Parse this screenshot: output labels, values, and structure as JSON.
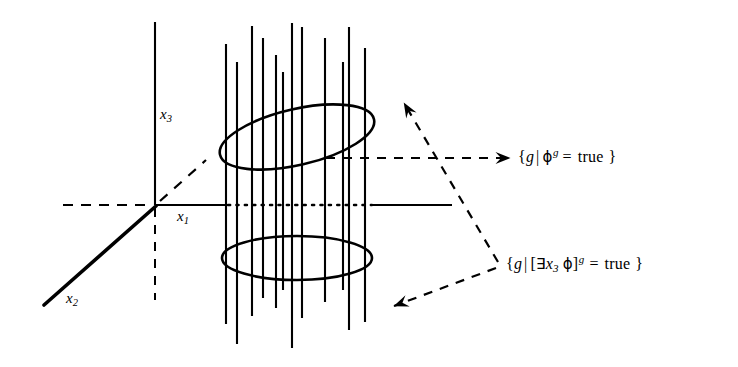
{
  "figure": {
    "background_color": "#ffffff",
    "ink_color": "#000000",
    "width": 738,
    "height": 367
  },
  "axes": {
    "x1": {
      "label_text": "x",
      "label_sub": "1",
      "name": "x1-axis",
      "orientation": "horizontal",
      "origin": [
        155,
        205
      ],
      "solid_from": [
        155,
        205
      ],
      "solid_to": [
        226,
        205
      ],
      "dotted_from": [
        226,
        205
      ],
      "dotted_to": [
        372,
        205
      ],
      "solid_tail_from": [
        372,
        205
      ],
      "solid_tail_to": [
        452,
        205
      ],
      "dashed_left_from": [
        63,
        205
      ],
      "dashed_left_to": [
        155,
        205
      ]
    },
    "x2": {
      "label_text": "x",
      "label_sub": "2",
      "name": "x2-axis",
      "orientation": "diagonal",
      "solid_from": [
        44,
        305
      ],
      "solid_to": [
        155,
        205
      ],
      "dashed_from": [
        155,
        205
      ],
      "dashed_to": [
        205,
        160
      ]
    },
    "x3": {
      "label_text": "x",
      "label_sub": "3",
      "name": "x3-axis",
      "orientation": "vertical",
      "solid_from": [
        155,
        22
      ],
      "solid_to": [
        155,
        205
      ],
      "dashed_from": [
        155,
        205
      ],
      "dashed_to": [
        155,
        300
      ]
    }
  },
  "cylinder": {
    "name": "cylinder",
    "top_ellipse": {
      "cx": 297,
      "cy": 137,
      "rx": 79,
      "ry": 28,
      "rotation_deg": -13
    },
    "bottom_ellipse": {
      "cx": 297,
      "cy": 258,
      "rx": 75,
      "ry": 22,
      "rotation_deg": 0
    },
    "fiber_lines": [
      {
        "x": 226,
        "y_top": 44,
        "y_bottom": 324
      },
      {
        "x": 237,
        "y_top": 62,
        "y_bottom": 344
      },
      {
        "x": 252,
        "y_top": 26,
        "y_bottom": 316
      },
      {
        "x": 263,
        "y_top": 38,
        "y_bottom": 298
      },
      {
        "x": 276,
        "y_top": 55,
        "y_bottom": 308
      },
      {
        "x": 283,
        "y_top": 72,
        "y_bottom": 290
      },
      {
        "x": 292,
        "y_top": 23,
        "y_bottom": 348
      },
      {
        "x": 302,
        "y_top": 27,
        "y_bottom": 318
      },
      {
        "x": 325,
        "y_top": 38,
        "y_bottom": 302
      },
      {
        "x": 343,
        "y_top": 62,
        "y_bottom": 290
      },
      {
        "x": 349,
        "y_top": 27,
        "y_bottom": 330
      },
      {
        "x": 365,
        "y_top": 48,
        "y_bottom": 322
      }
    ]
  },
  "annotations": [
    {
      "name": "phi-true-set-label",
      "id": "label-phi",
      "position": [
        518,
        146
      ],
      "parts": {
        "open_brace": "{",
        "g": "g",
        "bar": "|",
        "phi": "ϕ",
        "sup": "g",
        "eq": "=",
        "true": "true",
        "close_brace": "}"
      },
      "plain_text": "{ g | ϕ g = true }",
      "leader": {
        "type": "dashed-arrow",
        "from": [
          510,
          158
        ],
        "to": [
          313,
          158
        ],
        "arrowhead": "left"
      }
    },
    {
      "name": "exists-x3-phi-true-set-label",
      "id": "label-exists",
      "position": [
        506,
        253
      ],
      "parts": {
        "open_brace": "{",
        "g": "g",
        "bar": "|",
        "open_bracket": "[",
        "exists": "∃",
        "x": "x",
        "sub": "3",
        "phi": "ϕ",
        "close_bracket": "]",
        "sup": "g",
        "eq": "=",
        "true": "true",
        "close_brace": "}"
      },
      "plain_text": "{ g | [∃x3 ϕ] g = true }",
      "leaders": [
        {
          "type": "dashed-arrow",
          "from": [
            498,
            262
          ],
          "to": [
            396,
            96
          ],
          "arrowhead": "up-left"
        },
        {
          "type": "dashed-arrow",
          "from": [
            498,
            268
          ],
          "to": [
            386,
            310
          ],
          "arrowhead": "down-left"
        }
      ]
    }
  ]
}
